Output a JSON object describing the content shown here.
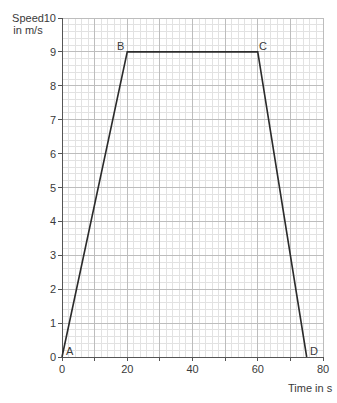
{
  "chart_data": {
    "type": "line",
    "title": "",
    "xlabel": "Time in s",
    "ylabel": "Speed in m/s",
    "ylabel_lines": [
      "Speed",
      "in m/s"
    ],
    "xlim": [
      0,
      80
    ],
    "ylim": [
      0,
      10
    ],
    "x_ticks": [
      0,
      20,
      40,
      60,
      80
    ],
    "y_ticks": [
      0,
      1,
      2,
      3,
      4,
      5,
      6,
      7,
      8,
      9,
      10
    ],
    "grid": true,
    "grid_minor": {
      "x_step": 2,
      "y_step": 0.2
    },
    "grid_major": {
      "x_step": 10,
      "y_step": 1
    },
    "series": [
      {
        "name": "speed-time graph",
        "points": [
          {
            "label": "A",
            "x": 0,
            "y": 0
          },
          {
            "label": "B",
            "x": 20,
            "y": 9
          },
          {
            "label": "C",
            "x": 60,
            "y": 9
          },
          {
            "label": "D",
            "x": 75,
            "y": 0
          }
        ]
      }
    ]
  },
  "labels": {
    "y_title_1": "Speed",
    "y_title_2": "in m/s",
    "x_title": "Time in s",
    "point_A": "A",
    "point_B": "B",
    "point_C": "C",
    "point_D": "D"
  },
  "ticks": {
    "y": [
      "0",
      "1",
      "2",
      "3",
      "4",
      "5",
      "6",
      "7",
      "8",
      "9",
      "10"
    ],
    "x": [
      "0",
      "20",
      "40",
      "60",
      "80"
    ]
  },
  "colors": {
    "grid_minor": "#e2e2e2",
    "grid_major": "#bdbdbd",
    "axis": "#555555",
    "line": "#2b2b2b"
  }
}
